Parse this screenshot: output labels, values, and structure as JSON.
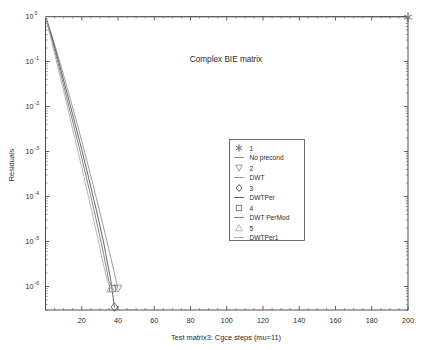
{
  "chart_data": {
    "type": "line",
    "title": "Complex BIE matrix",
    "xlabel": "Test matrix3: Cgce steps (mu=11)",
    "ylabel": "Residuals",
    "yscale": "log",
    "xscale": "linear",
    "xlim": [
      0,
      200
    ],
    "ylim": [
      3e-07,
      1.0
    ],
    "grid": false,
    "legend_position": "center",
    "xticks": [
      0,
      20,
      40,
      60,
      80,
      100,
      120,
      140,
      160,
      180,
      200
    ],
    "xtick_labels": [
      "",
      "20",
      "40",
      "60",
      "80",
      "100",
      "120",
      "140",
      "160",
      "180",
      "200"
    ],
    "yticks": [
      1.0,
      0.1,
      0.01,
      0.001,
      0.0001,
      1e-05,
      1e-06
    ],
    "ytick_labels": [
      "10^0",
      "10^-1",
      "10^-2",
      "10^-3",
      "10^-4",
      "10^-5",
      "10^-6"
    ],
    "ytick_mantissa": [
      "10",
      "10",
      "10",
      "10",
      "10",
      "10",
      "10"
    ],
    "ytick_exponent": [
      "0",
      "-1",
      "-2",
      "-3",
      "-4",
      "-5",
      "-6"
    ],
    "series": [
      {
        "name": "No precond",
        "legend_index": "1",
        "marker": "star",
        "color": "#7a7a7a",
        "x": [
          0,
          2,
          6,
          12,
          24,
          40,
          70,
          110,
          150,
          180,
          200
        ],
        "y": [
          1.0,
          0.99,
          0.985,
          0.982,
          0.979,
          0.977,
          0.975,
          0.973,
          0.972,
          0.971,
          0.97
        ]
      },
      {
        "name": "DWT",
        "legend_index": "2",
        "marker": "triangle-down",
        "color": "#8c8c8c",
        "x": [
          0,
          4,
          8,
          12,
          16,
          20,
          24,
          28,
          32,
          36,
          40
        ],
        "y": [
          1.0,
          0.33,
          0.095,
          0.026,
          0.0068,
          0.0017,
          0.00041,
          9.5e-05,
          2.1e-05,
          4.4e-06,
          9e-07
        ]
      },
      {
        "name": "DWTPer",
        "legend_index": "3",
        "marker": "diamond",
        "color": "#4a4a4a",
        "x": [
          0,
          4,
          8,
          12,
          16,
          20,
          24,
          28,
          32,
          36,
          38
        ],
        "y": [
          1.0,
          0.3,
          0.077,
          0.019,
          0.0046,
          0.0011,
          0.00024,
          5.1e-05,
          9.8e-06,
          1.4e-06,
          3.5e-07
        ]
      },
      {
        "name": "DWT PerMod",
        "legend_index": "4",
        "marker": "square",
        "color": "#6e6e6e",
        "x": [
          0,
          4,
          8,
          12,
          16,
          20,
          24,
          28,
          32,
          35,
          37
        ],
        "y": [
          1.0,
          0.26,
          0.062,
          0.014,
          0.0032,
          0.00072,
          0.00015,
          3e-05,
          5.4e-06,
          1.3e-06,
          9e-07
        ]
      },
      {
        "name": "DWTPer1",
        "legend_index": "5",
        "marker": "triangle-up",
        "color": "#a8a8a8",
        "x": [
          0,
          4,
          8,
          12,
          16,
          20,
          24,
          28,
          32,
          34,
          36
        ],
        "y": [
          1.0,
          0.22,
          0.048,
          0.0102,
          0.0021,
          0.00044,
          8.8e-05,
          1.68e-05,
          3e-06,
          1.4e-06,
          9e-07
        ]
      }
    ],
    "legend_entries": [
      {
        "index_label": "1",
        "name_label": "No precond",
        "marker": "star"
      },
      {
        "index_label": "2",
        "name_label": "DWT",
        "marker": "triangle-down"
      },
      {
        "index_label": "3",
        "name_label": "DWTPer",
        "marker": "diamond"
      },
      {
        "index_label": "4",
        "name_label": "DWT PerMod",
        "marker": "square"
      },
      {
        "index_label": "5",
        "name_label": "DWTPer1",
        "marker": "triangle-up"
      }
    ],
    "endpoint_markers": [
      {
        "series": "No precond",
        "marker": "star",
        "x": 200,
        "y": 0.97
      },
      {
        "series": "DWT",
        "marker": "triangle-down",
        "x": 40,
        "y": 9e-07
      },
      {
        "series": "DWTPer",
        "marker": "diamond",
        "x": 38,
        "y": 3.5e-07
      },
      {
        "series": "DWT PerMod",
        "marker": "square",
        "x": 37,
        "y": 9e-07
      },
      {
        "series": "DWTPer1",
        "marker": "triangle-up",
        "x": 36,
        "y": 9e-07
      }
    ]
  },
  "colors": {
    "axis": "#3a3a3a",
    "text": "#2b2b2b",
    "background": "#ffffff"
  }
}
